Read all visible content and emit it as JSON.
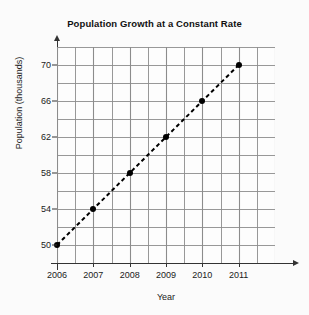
{
  "chart_data": {
    "type": "line",
    "title": "Population Growth at a Constant Rate",
    "xlabel": "Year",
    "ylabel": "Population (thousands)",
    "x": [
      2006,
      2007,
      2008,
      2009,
      2010,
      2011
    ],
    "values": [
      50,
      54,
      58,
      62,
      66,
      70
    ],
    "series": [
      {
        "name": "Population",
        "values": [
          50,
          54,
          58,
          62,
          66,
          70
        ],
        "line_style": "dashed",
        "marker": "filled-circle",
        "color": "#000000"
      }
    ],
    "xlim": [
      2006,
      2012
    ],
    "ylim": [
      48,
      72
    ],
    "x_tick_labels": [
      "2006",
      "2007",
      "2008",
      "2009",
      "2010",
      "2011"
    ],
    "y_tick_labels": [
      "50",
      "54",
      "58",
      "62",
      "66",
      "70"
    ],
    "y_tick_values": [
      50,
      54,
      58,
      62,
      66,
      70
    ],
    "y_minor_step": 2,
    "x_minor_step": 0.5,
    "grid": true,
    "grid_color": "#8c8c8c",
    "legend": "none",
    "background_color": "#fbfbfb",
    "axis_color": "#333333"
  },
  "chart": {
    "title": "Population Growth at a Constant Rate",
    "x_axis_title": "Year",
    "y_axis_title": "Population (thousands)"
  }
}
